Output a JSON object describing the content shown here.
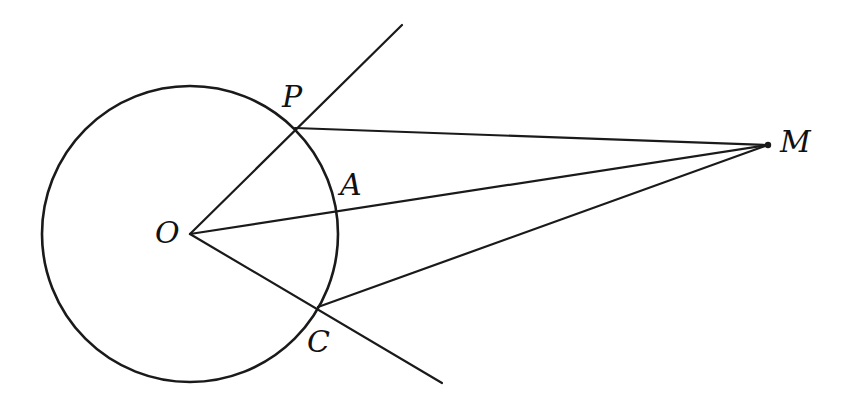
{
  "diagram": {
    "colors": {
      "stroke": "#1a1a1a",
      "background": "#ffffff",
      "label": "#111111"
    },
    "circle": {
      "center_label": "O",
      "cx": 190,
      "cy": 234,
      "r": 148
    },
    "points": {
      "O": {
        "label": "O",
        "x": 190,
        "y": 234
      },
      "P": {
        "label": "P",
        "x": 295,
        "y": 128
      },
      "A": {
        "label": "A",
        "x": 338,
        "y": 210
      },
      "C": {
        "label": "C",
        "x": 318,
        "y": 307
      },
      "M": {
        "label": "M",
        "x": 768,
        "y": 145
      }
    },
    "segments": [
      {
        "name": "ray-OP",
        "from": "O",
        "to": "P-extended",
        "x1": 190,
        "y1": 234,
        "x2": 402,
        "y2": 25
      },
      {
        "name": "ray-OC",
        "from": "O",
        "to": "C-extended",
        "x1": 190,
        "y1": 234,
        "x2": 442,
        "y2": 383
      },
      {
        "name": "segment-OM",
        "from": "O",
        "to": "M",
        "x1": 190,
        "y1": 234,
        "x2": 768,
        "y2": 145
      },
      {
        "name": "segment-PM",
        "from": "P",
        "to": "M",
        "x1": 295,
        "y1": 128,
        "x2": 768,
        "y2": 145
      },
      {
        "name": "segment-CM",
        "from": "C",
        "to": "M",
        "x1": 318,
        "y1": 307,
        "x2": 768,
        "y2": 145
      }
    ],
    "labels": [
      {
        "text": "P",
        "x": 282,
        "y": 82
      },
      {
        "text": "A",
        "x": 340,
        "y": 170
      },
      {
        "text": "O",
        "x": 155,
        "y": 218
      },
      {
        "text": "C",
        "x": 307,
        "y": 327
      },
      {
        "text": "M",
        "x": 780,
        "y": 127
      }
    ]
  }
}
